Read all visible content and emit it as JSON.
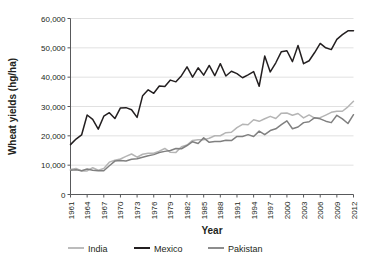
{
  "chart_data": {
    "type": "line",
    "title": "",
    "xlabel": "Year",
    "ylabel": "Wheat yields (hg/ha)",
    "xlim": [
      1961,
      2012
    ],
    "ylim": [
      0,
      60000
    ],
    "grid": true,
    "legend_position": "bottom",
    "ytick_labels": [
      "0",
      "10,000",
      "20,000",
      "30,000",
      "40,000",
      "50,000",
      "60,000"
    ],
    "ytick_values": [
      0,
      10000,
      20000,
      30000,
      40000,
      50000,
      60000
    ],
    "xtick_labels": [
      "1961",
      "1964",
      "1967",
      "1970",
      "1973",
      "1976",
      "1979",
      "1982",
      "1985",
      "1988",
      "1991",
      "1994",
      "1997",
      "2000",
      "2003",
      "2006",
      "2009",
      "2012"
    ],
    "xtick_values": [
      1961,
      1964,
      1967,
      1970,
      1973,
      1976,
      1979,
      1982,
      1985,
      1988,
      1991,
      1994,
      1997,
      2000,
      2003,
      2006,
      2009,
      2012
    ],
    "x": [
      1961,
      1962,
      1963,
      1964,
      1965,
      1966,
      1967,
      1968,
      1969,
      1970,
      1971,
      1972,
      1973,
      1974,
      1975,
      1976,
      1977,
      1978,
      1979,
      1980,
      1981,
      1982,
      1983,
      1984,
      1985,
      1986,
      1987,
      1988,
      1989,
      1990,
      1991,
      1992,
      1993,
      1994,
      1995,
      1996,
      1997,
      1998,
      1999,
      2000,
      2001,
      2002,
      2003,
      2004,
      2005,
      2006,
      2007,
      2008,
      2009,
      2010,
      2011,
      2012
    ],
    "series": [
      {
        "name": "India",
        "color": "#b5b5b5",
        "values": [
          8510,
          8900,
          8010,
          8050,
          9130,
          8270,
          8870,
          11030,
          11690,
          12090,
          12990,
          13800,
          12710,
          13720,
          14100,
          14100,
          14800,
          15700,
          14400,
          14360,
          16300,
          16880,
          18430,
          18700,
          18700,
          19160,
          20020,
          20030,
          21090,
          21210,
          22810,
          23940,
          23800,
          25500,
          24940,
          25830,
          26650,
          25900,
          27740,
          27800,
          27030,
          27620,
          26100,
          27130,
          26020,
          26190,
          27080,
          28020,
          28390,
          28390,
          29890,
          31770
        ]
      },
      {
        "name": "Mexico",
        "color": "#231f20",
        "values": [
          17000,
          18900,
          20300,
          27100,
          25600,
          22300,
          26700,
          27900,
          25900,
          29500,
          29600,
          28900,
          26300,
          33700,
          35700,
          34500,
          37000,
          36800,
          39000,
          38400,
          40500,
          43500,
          40000,
          43200,
          40700,
          44000,
          40500,
          44600,
          40400,
          42000,
          41200,
          39800,
          40800,
          41900,
          36900,
          47200,
          41800,
          44900,
          48700,
          49000,
          45300,
          50800,
          44600,
          45600,
          48400,
          51500,
          50000,
          49400,
          52900,
          54500,
          55800,
          55800
        ]
      },
      {
        "name": "Pakistan",
        "color": "#808080",
        "values": [
          8300,
          8400,
          8100,
          8700,
          8300,
          8100,
          8100,
          9800,
          11400,
          11600,
          11400,
          12000,
          12200,
          12700,
          13200,
          13600,
          14300,
          14700,
          15000,
          15700,
          15600,
          16700,
          18000,
          17400,
          19300,
          17800,
          18100,
          18100,
          18500,
          18400,
          19800,
          19800,
          20400,
          19800,
          21600,
          20400,
          21800,
          22400,
          23800,
          25100,
          22400,
          23000,
          24500,
          24800,
          26200,
          25800,
          25000,
          24500,
          27000,
          25800,
          24200,
          27200
        ]
      }
    ],
    "legend": [
      {
        "label": "India",
        "color": "#b5b5b5"
      },
      {
        "label": "Mexico",
        "color": "#231f20"
      },
      {
        "label": "Pakistan",
        "color": "#808080"
      }
    ]
  }
}
